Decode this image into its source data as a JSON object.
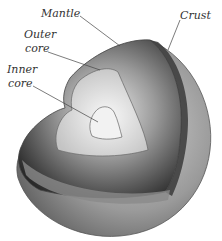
{
  "diagram": {
    "labels": {
      "mantle": "Mantle",
      "crust": "Crust",
      "outer_core_line1": "Outer",
      "outer_core_line2": "core",
      "inner_core_line1": "Inner",
      "inner_core_line2": "core"
    },
    "colors": {
      "background": "#ffffff",
      "label_text": "#333333",
      "leader_line": "#444444",
      "surface_dark": "#5a5a5a",
      "surface_light": "#c8c8c8",
      "mantle_dark": "#2e2e2e",
      "outer_core": "#d8d8d8",
      "inner_core": "#f0f0f0"
    }
  }
}
